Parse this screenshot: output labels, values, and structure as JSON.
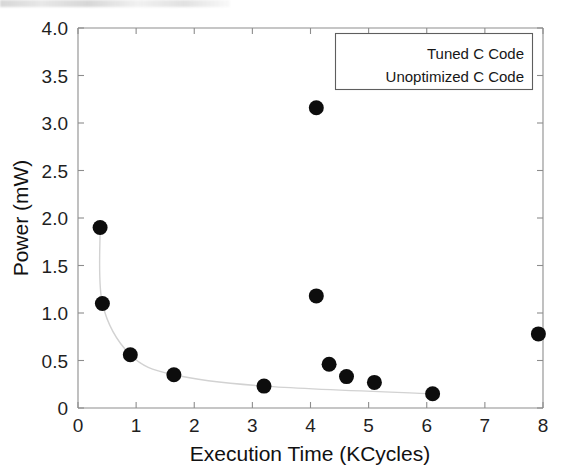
{
  "chart_data": {
    "type": "scatter",
    "title": "",
    "xlabel": "Execution Time (KCycles)",
    "ylabel": "Power (mW)",
    "xlim": [
      0,
      8
    ],
    "ylim": [
      0,
      4.0
    ],
    "xticks": [
      "0",
      "1",
      "2",
      "3",
      "4",
      "5",
      "6",
      "7",
      "8"
    ],
    "xtick_values": [
      0,
      1,
      2,
      3,
      4,
      5,
      6,
      7,
      8
    ],
    "yticks": [
      "0",
      "0.5",
      "1.0",
      "1.5",
      "2.0",
      "2.5",
      "3.0",
      "3.5",
      "4.0"
    ],
    "ytick_values": [
      0,
      0.5,
      1.0,
      1.5,
      2.0,
      2.5,
      3.0,
      3.5,
      4.0
    ],
    "grid": false,
    "legend_position": "upper right",
    "marker_color": "#0d0d0d",
    "curve_color": "#d2d2d2",
    "axis_color": "#8d8d8d",
    "series": [
      {
        "name": "Tuned C Code",
        "connected": true,
        "points": [
          {
            "x": 0.38,
            "y": 1.9
          },
          {
            "x": 0.42,
            "y": 1.1
          },
          {
            "x": 0.9,
            "y": 0.56
          },
          {
            "x": 1.65,
            "y": 0.35
          },
          {
            "x": 3.2,
            "y": 0.23
          },
          {
            "x": 6.1,
            "y": 0.15
          }
        ]
      },
      {
        "name": "Unoptimized C Code",
        "connected": false,
        "points": [
          {
            "x": 4.1,
            "y": 3.16
          },
          {
            "x": 4.1,
            "y": 1.18
          },
          {
            "x": 4.32,
            "y": 0.46
          },
          {
            "x": 4.62,
            "y": 0.33
          },
          {
            "x": 5.1,
            "y": 0.27
          },
          {
            "x": 7.92,
            "y": 0.78
          }
        ]
      }
    ]
  },
  "legend": {
    "entries": [
      {
        "label": "Tuned C Code"
      },
      {
        "label": "Unoptimized C Code"
      }
    ]
  }
}
